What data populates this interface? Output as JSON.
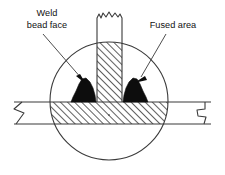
{
  "figure": {
    "background_color": "#ffffff",
    "line_color": "#3a3a3a",
    "bead_fill_color": "#0d0d0d",
    "hatch_color": "#2b2b2b"
  },
  "labels": {
    "weld_bead_face": {
      "line1": "Weld",
      "line2": "bead face"
    },
    "fused_area": {
      "line1": "Fused area"
    }
  },
  "parts": {
    "base_plate_name": "base-plate",
    "vertical_member_name": "vertical-member",
    "left_bead_name": "left-weld-bead",
    "right_bead_name": "right-weld-bead",
    "fusion_circle_name": "fusion-zone-circle"
  }
}
